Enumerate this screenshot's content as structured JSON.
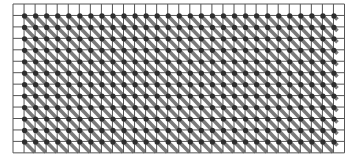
{
  "diagram": {
    "type": "grid-pattern",
    "grid": {
      "columns": 30,
      "rows": 13,
      "origin_x": 13,
      "origin_y": 4,
      "cell_width": 11.05,
      "cell_height": 11.45,
      "line_color": "#555555",
      "line_width": 1
    },
    "marks": {
      "dot_color": "#2e2e2e",
      "dot_radius": 2.6,
      "diagonal_color": "#7a7a7a",
      "diagonal_width": 3.6,
      "diagonal_direction": "top-left-to-bottom-right",
      "dot_columns_start": 1,
      "dot_columns_end": 29,
      "dot_rows_start": 1,
      "dot_rows_end": 12,
      "diagonal_columns_end": 28
    },
    "background": "#ffffff"
  }
}
